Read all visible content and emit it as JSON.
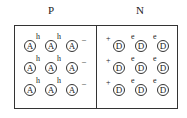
{
  "labels": {
    "p": "P",
    "n": "N"
  },
  "p_region": {
    "ion_symbol": "A",
    "hole_symbol": "h",
    "charge_symbol": "–",
    "rows": 3,
    "cols": 3
  },
  "n_region": {
    "ion_symbol": "D",
    "electron_symbol": "e",
    "charge_symbol": "+",
    "rows": 3,
    "cols": 3
  }
}
